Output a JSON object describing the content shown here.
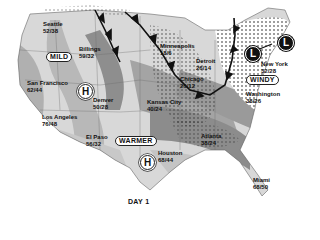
{
  "caption": "DAY 1",
  "colors": {
    "background": "#ffffff",
    "land_light": "#dcdcdc",
    "land_mid": "#b4b4b4",
    "land_dark": "#8c8c8c",
    "front": "#111111"
  },
  "labels": {
    "mild": "MILD",
    "warmer": "WARMER",
    "windy": "WINDY"
  },
  "pressure_systems": {
    "highs": [
      {
        "symbol": "H",
        "location": "Nevada/Utah"
      },
      {
        "symbol": "H",
        "location": "Texas"
      }
    ],
    "lows": [
      {
        "symbol": "L",
        "location": "Pennsylvania"
      },
      {
        "symbol": "L",
        "location": "Maine"
      }
    ]
  },
  "cities": [
    {
      "name": "Seattle",
      "temps": "52/38"
    },
    {
      "name": "Billings",
      "temps": "59/32"
    },
    {
      "name": "San Francisco",
      "temps": "62/44"
    },
    {
      "name": "Los Angeles",
      "temps": "76/48"
    },
    {
      "name": "Denver",
      "temps": "50/28"
    },
    {
      "name": "El Paso",
      "temps": "56/32"
    },
    {
      "name": "Kansas City",
      "temps": "40/24"
    },
    {
      "name": "Minneapolis",
      "temps": "18/6"
    },
    {
      "name": "Detroit",
      "temps": "26/14"
    },
    {
      "name": "Chicago",
      "temps": "26/12"
    },
    {
      "name": "New York",
      "temps": "32/28"
    },
    {
      "name": "Washington",
      "temps": "38/26"
    },
    {
      "name": "Atlanta",
      "temps": "38/24"
    },
    {
      "name": "Houston",
      "temps": "68/44"
    },
    {
      "name": "Miami",
      "temps": "68/50"
    }
  ]
}
